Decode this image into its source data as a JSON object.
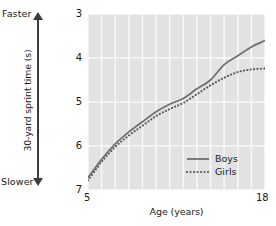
{
  "chart_data": {
    "type": "line",
    "title": "",
    "xlabel": "Age (years)",
    "ylabel": "30-yard sprint time (s)",
    "xlim": [
      5,
      18
    ],
    "ylim": [
      3,
      7
    ],
    "y_inverted": true,
    "grid": true,
    "legend_position": "bottom-right",
    "x_tick_labels": [
      "5",
      "18"
    ],
    "y_tick_labels": [
      "3",
      "4",
      "5",
      "6",
      "7"
    ],
    "y_ticks": [
      3,
      4,
      5,
      6,
      7
    ],
    "x_ticks": [
      5,
      18
    ],
    "axis_annotations": {
      "top": "Faster",
      "bottom": "Slower"
    },
    "x": [
      5,
      6,
      7,
      8,
      9,
      10,
      11,
      12,
      13,
      14,
      15,
      16,
      17,
      18
    ],
    "series": [
      {
        "name": "Boys",
        "style": "solid",
        "color": "#6e6e6e",
        "values": [
          6.72,
          6.3,
          5.95,
          5.68,
          5.45,
          5.22,
          5.05,
          4.92,
          4.7,
          4.5,
          4.15,
          3.95,
          3.75,
          3.6
        ]
      },
      {
        "name": "Girls",
        "style": "dotted",
        "color": "#5a5a5a",
        "values": [
          6.78,
          6.36,
          6.02,
          5.76,
          5.54,
          5.32,
          5.16,
          5.02,
          4.82,
          4.62,
          4.45,
          4.32,
          4.26,
          4.24
        ]
      }
    ],
    "legend": [
      {
        "label": "Boys",
        "style": "solid"
      },
      {
        "label": "Girls",
        "style": "dotted"
      }
    ],
    "colors": {
      "plot_background": "#e2e2e2",
      "gridline": "#f7f7f7",
      "axis": "#3b3b3b",
      "text": "#1a1a1a"
    }
  }
}
